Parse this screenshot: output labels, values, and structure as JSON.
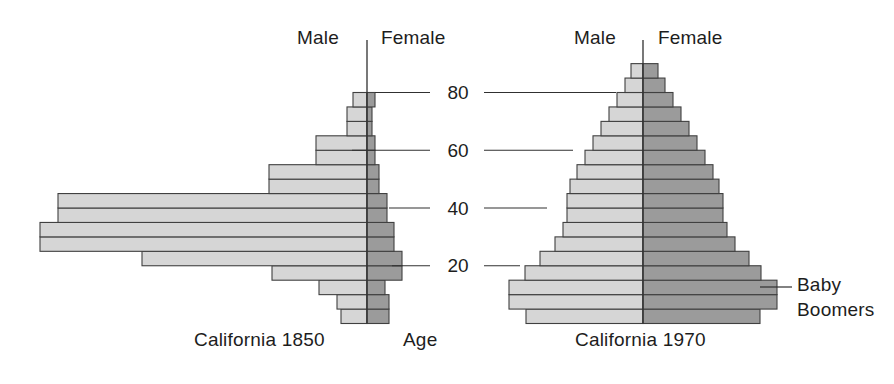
{
  "figure": {
    "axis_label": "Age",
    "annotation": {
      "line1": "Baby Boomers",
      "word1": "Baby",
      "word2": "Boomers"
    },
    "tick_labels": [
      "80",
      "60",
      "40",
      "20"
    ],
    "tick_values": [
      80,
      60,
      40,
      20
    ],
    "colors": {
      "male_fill": "#d6d6d6",
      "female_fill": "#9b9b9b",
      "stroke": "#404040",
      "text": "#1d1d1d"
    }
  },
  "panels": [
    {
      "id": "california-1850",
      "caption": "California 1850",
      "male_label": "Male",
      "female_label": "Female"
    },
    {
      "id": "california-1970",
      "caption": "California 1970",
      "male_label": "Male",
      "female_label": "Female"
    }
  ],
  "chart_data": {
    "type": "bar",
    "subtype": "population-pyramid",
    "title": "",
    "xlabel": "Population",
    "ylabel": "Age",
    "ylim": [
      0,
      95
    ],
    "grid": false,
    "legend_position": "top-inline",
    "age_groups": [
      "0-4",
      "5-9",
      "10-14",
      "15-19",
      "20-24",
      "25-29",
      "30-34",
      "35-39",
      "40-44",
      "45-49",
      "50-54",
      "55-59",
      "60-64",
      "65-69",
      "70-74",
      "75-79",
      "80-84",
      "85+"
    ],
    "panels": [
      {
        "name": "California 1850",
        "units": "relative population width (px-equivalent)",
        "series": [
          {
            "name": "Male",
            "side": "left",
            "values": [
              26,
              30,
              48,
              95,
              225,
              327,
              327,
              309,
              309,
              98,
              98,
              51,
              51,
              20,
              20,
              14,
              0,
              0
            ]
          },
          {
            "name": "Female",
            "side": "right",
            "values": [
              22,
              22,
              18,
              35,
              35,
              27,
              27,
              20,
              20,
              12,
              12,
              8,
              8,
              5,
              5,
              8,
              0,
              0
            ]
          }
        ]
      },
      {
        "name": "California 1970",
        "units": "relative population width (px-equivalent)",
        "series": [
          {
            "name": "Male",
            "side": "left",
            "values": [
              117,
              134,
              134,
              118,
              103,
              88,
              80,
              76,
              76,
              73,
              66,
              58,
              50,
              42,
              34,
              26,
              18,
              12
            ]
          },
          {
            "name": "Female",
            "side": "right",
            "values": [
              117,
              134,
              134,
              118,
              106,
              92,
              84,
              80,
              80,
              76,
              70,
              62,
              54,
              46,
              38,
              30,
              22,
              15
            ]
          }
        ]
      }
    ],
    "annotations": [
      {
        "text": "Baby Boomers",
        "points_to": "California 1970 female cohorts aged 5-19"
      }
    ]
  }
}
